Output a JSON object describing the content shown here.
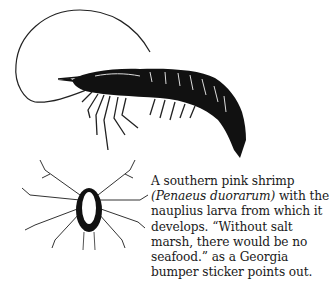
{
  "figure": {
    "illustrations": [
      {
        "name": "southern-pink-shrimp",
        "description": "Adult shrimp line drawing"
      },
      {
        "name": "nauplius-larva",
        "description": "Nauplius larva line drawing"
      }
    ],
    "caption": {
      "lines": [
        {
          "text": "A southern pink shrimp"
        },
        {
          "italic": "(Penaeus duorarum)",
          "text": " with the"
        },
        {
          "text": "nauplius larva from which it"
        },
        {
          "text": "develops. “Without salt"
        },
        {
          "text": "marsh, there would be no"
        },
        {
          "text": "seafood.” as a Georgia"
        },
        {
          "text": "bumper sticker points out."
        }
      ]
    }
  }
}
